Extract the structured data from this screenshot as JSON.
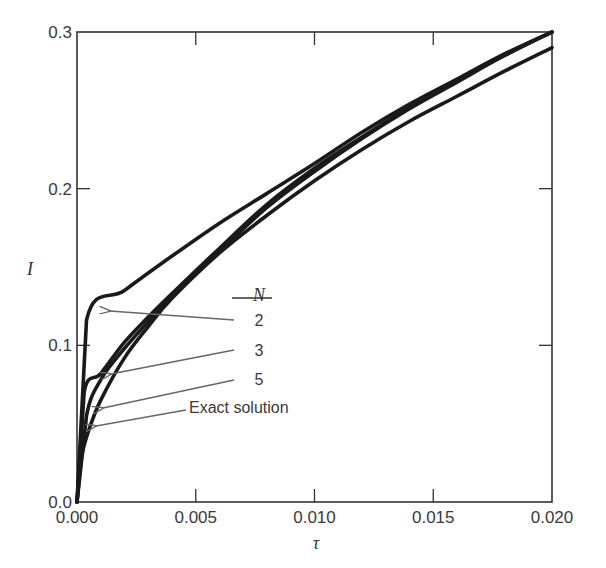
{
  "chart_data": {
    "type": "line",
    "title": "",
    "xlabel": "τ",
    "ylabel": "I",
    "xlim": [
      0.0,
      0.02
    ],
    "ylim": [
      0.0,
      0.3
    ],
    "grid": false,
    "x_ticks": [
      "0.000",
      "0.005",
      "0.010",
      "0.015",
      "0.020"
    ],
    "y_ticks": [
      "0.0",
      "0.1",
      "0.2",
      "0.3"
    ],
    "legend": {
      "title": "N",
      "entries": [
        "2",
        "3",
        "5",
        "Exact solution"
      ],
      "position": "inside, center-left, with arrows pointing to curves"
    },
    "series": [
      {
        "name": "N = 2",
        "x": [
          0.0,
          0.0004,
          0.002,
          0.004,
          0.006,
          0.008,
          0.01,
          0.012,
          0.014,
          0.016,
          0.018,
          0.02
        ],
        "y": [
          0.0,
          0.116,
          0.135,
          0.157,
          0.178,
          0.197,
          0.216,
          0.236,
          0.254,
          0.27,
          0.286,
          0.3
        ]
      },
      {
        "name": "N = 3",
        "x": [
          0.0,
          0.0003,
          0.001,
          0.002,
          0.003,
          0.004,
          0.006,
          0.008,
          0.01,
          0.012,
          0.014,
          0.016,
          0.018,
          0.02
        ],
        "y": [
          0.0,
          0.07,
          0.082,
          0.102,
          0.118,
          0.133,
          0.162,
          0.19,
          0.213,
          0.233,
          0.252,
          0.269,
          0.285,
          0.3
        ]
      },
      {
        "name": "N = 5",
        "x": [
          0.0,
          0.0004,
          0.001,
          0.002,
          0.003,
          0.004,
          0.006,
          0.008,
          0.01,
          0.012,
          0.014,
          0.016,
          0.018,
          0.02
        ],
        "y": [
          0.0,
          0.055,
          0.078,
          0.098,
          0.115,
          0.131,
          0.16,
          0.188,
          0.211,
          0.232,
          0.251,
          0.268,
          0.285,
          0.3
        ]
      },
      {
        "name": "Exact solution",
        "x": [
          0.0,
          0.0002,
          0.0005,
          0.001,
          0.002,
          0.003,
          0.004,
          0.006,
          0.008,
          0.01,
          0.012,
          0.014,
          0.016,
          0.018,
          0.02
        ],
        "y": [
          0.0,
          0.029,
          0.046,
          0.065,
          0.092,
          0.112,
          0.13,
          0.159,
          0.183,
          0.205,
          0.225,
          0.243,
          0.259,
          0.275,
          0.29
        ]
      }
    ]
  },
  "colors": {
    "curve": "#1a1a1a",
    "axis": "#333333",
    "arrow": "#666666",
    "text": "#3a3a3a"
  }
}
